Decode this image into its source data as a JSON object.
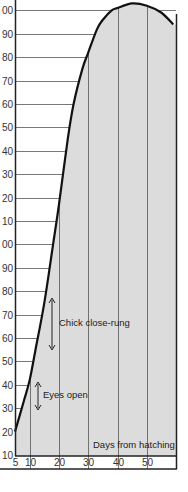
{
  "chart_data": {
    "type": "area",
    "title": "",
    "xlabel": "Days from hatching",
    "ylabel": "",
    "x_ticks": [
      5,
      10,
      20,
      30,
      40,
      50
    ],
    "y_tick_labels": [
      "00",
      "90",
      "80",
      "70",
      "60",
      "50",
      "40",
      "30",
      "20",
      "10",
      "00",
      "90",
      "80",
      "70",
      "60",
      "50",
      "40",
      "30",
      "20",
      "10"
    ],
    "y_ticks": [
      200,
      190,
      180,
      170,
      160,
      150,
      140,
      130,
      120,
      110,
      100,
      90,
      80,
      70,
      60,
      50,
      40,
      30,
      20,
      10
    ],
    "xlim": [
      5,
      60
    ],
    "ylim": [
      10,
      200
    ],
    "grid": true,
    "legend": null,
    "series": [
      {
        "name": "Growth curve",
        "x": [
          5,
          8,
          10,
          12,
          15,
          18,
          20,
          23,
          25,
          28,
          30,
          33,
          35,
          38,
          40,
          45,
          50,
          55,
          59
        ],
        "y": [
          20,
          33,
          42,
          55,
          75,
          100,
          117,
          145,
          160,
          175,
          182,
          192,
          196,
          200,
          201,
          203,
          202,
          199,
          194
        ]
      }
    ],
    "annotations": [
      {
        "text": "Eyes open",
        "x": 13,
        "y_range": [
          31,
          42
        ]
      },
      {
        "text": "Chick close-rung",
        "x": 17,
        "y_range": [
          54,
          76
        ]
      },
      {
        "text": "Days from hatching",
        "position": "bottom-right"
      }
    ]
  },
  "labels": {
    "eyes_open": "Eyes open",
    "chick_close_rung": "Chick close-rung",
    "x_axis_title": "Days from hatching"
  }
}
